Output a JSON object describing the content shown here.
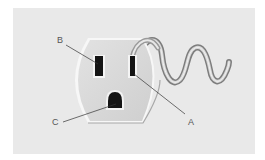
{
  "diagram": {
    "labels": {
      "a": "A",
      "b": "B",
      "c": "C"
    },
    "colors": {
      "background": "#e9e9e9",
      "faceplate": "#d9d9d9",
      "rim": "#f6f6f6",
      "slot": "#1a1a1a",
      "leader": "#333333",
      "cord": "#9a9a9a"
    },
    "parts": [
      {
        "label": "A",
        "name": "narrow slot (hot)"
      },
      {
        "label": "B",
        "name": "wide slot (neutral)"
      },
      {
        "label": "C",
        "name": "ground hole"
      }
    ]
  }
}
